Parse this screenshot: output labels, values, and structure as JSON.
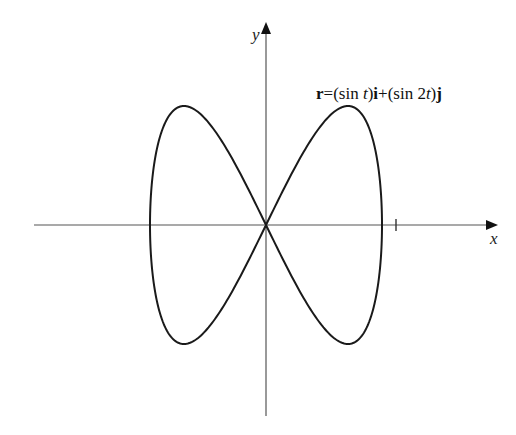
{
  "figure": {
    "x_axis_label": "x",
    "y_axis_label": "y",
    "tick_label": "1",
    "equation": {
      "r": "r",
      "eq_sign": "=",
      "part1_open": "(sin ",
      "part1_var": "t",
      "part1_close": ")",
      "i": "i",
      "plus": "+",
      "part2_open": "(sin 2",
      "part2_var": "t",
      "part2_close": ")",
      "j": "j"
    }
  },
  "chart_data": {
    "type": "line",
    "title": "r=(sin t)i+(sin 2t)j",
    "xlabel": "x",
    "ylabel": "y",
    "x_ticks": [
      1
    ],
    "xlim": [
      -1.1,
      1.1
    ],
    "ylim": [
      -1.1,
      1.1
    ],
    "parametric": {
      "x": "sin t",
      "y": "sin 2t",
      "t_range": [
        0,
        6.2832
      ]
    },
    "points": [
      [
        0,
        0
      ],
      [
        0.383,
        0.707
      ],
      [
        0.707,
        1.0
      ],
      [
        0.924,
        0.707
      ],
      [
        1.0,
        0.0
      ],
      [
        0.924,
        -0.707
      ],
      [
        0.707,
        -1.0
      ],
      [
        0.383,
        -0.707
      ],
      [
        0,
        0
      ],
      [
        -0.383,
        0.707
      ],
      [
        -0.707,
        1.0
      ],
      [
        -0.924,
        0.707
      ],
      [
        -1.0,
        0.0
      ],
      [
        -0.924,
        -0.707
      ],
      [
        -0.707,
        -1.0
      ],
      [
        -0.383,
        -0.707
      ],
      [
        0,
        0
      ]
    ],
    "grid": false,
    "legend": null
  }
}
